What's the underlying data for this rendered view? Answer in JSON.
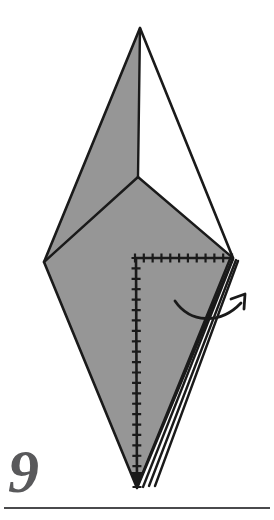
{
  "page": {
    "width": 274,
    "height": 520,
    "background_color": "#ffffff",
    "kind": "origami-instruction-step"
  },
  "step": {
    "number": "9",
    "number_color": "#59595b"
  },
  "rule": {
    "color": "#4a4a4c"
  },
  "colors": {
    "paper_front": "#969696",
    "paper_back": "#ffffff",
    "outline": "#1a1a1a",
    "hatch": "#1a1a1a",
    "arrow": "#1a1a1a"
  },
  "figure": {
    "vertices": {
      "apex": [
        140,
        28
      ],
      "left": [
        44,
        262
      ],
      "right": [
        233,
        258
      ],
      "bottom": [
        137,
        488
      ],
      "center": [
        138,
        177
      ]
    },
    "faces": [
      {
        "name": "upper-left-face",
        "fill": "paper_front",
        "points": "140,28 138,177 44,262"
      },
      {
        "name": "upper-right-face",
        "fill": "paper_back",
        "points": "140,28 233,258 138,177"
      },
      {
        "name": "lower-body-face",
        "fill": "paper_front",
        "points": "44,262 138,177 233,258 137,488"
      }
    ],
    "fold_lines": [
      {
        "name": "center-vertical-crease",
        "from": [
          140,
          28
        ],
        "to": [
          138,
          177
        ]
      },
      {
        "name": "center-left-crease",
        "from": [
          138,
          177
        ],
        "to": [
          44,
          262
        ]
      },
      {
        "name": "center-right-crease",
        "from": [
          138,
          177
        ],
        "to": [
          233,
          258
        ]
      }
    ],
    "layer_edges": [
      {
        "name": "layer-edge-1",
        "from": [
          230,
          259
        ],
        "to": [
          137,
          487
        ]
      },
      {
        "name": "layer-edge-2",
        "from": [
          233,
          259
        ],
        "to": [
          143,
          487
        ]
      },
      {
        "name": "layer-edge-3",
        "from": [
          236,
          260
        ],
        "to": [
          149,
          486
        ]
      },
      {
        "name": "layer-edge-4",
        "from": [
          238,
          261
        ],
        "to": [
          155,
          486
        ]
      }
    ]
  },
  "hatched_lines": [
    {
      "name": "horizontal-raw-edge",
      "orientation": "horizontal",
      "from": [
        135,
        258
      ],
      "to": [
        232,
        258
      ],
      "tick_count": 11,
      "tick_length": 9,
      "has_arrowhead": false
    },
    {
      "name": "vertical-raw-edge",
      "orientation": "vertical",
      "from": [
        136,
        258
      ],
      "to": [
        137,
        487
      ],
      "tick_count": 22,
      "tick_length": 9,
      "has_arrowhead": true,
      "arrowhead_at": "end"
    }
  ],
  "arrows": [
    {
      "name": "fold-rotate-arrow",
      "style": "curved-open-head",
      "description": "curved arrow sweeping from inside the model rightward and upward, indicating the flap rotates to the right",
      "path": "M 175,301 C 190,323 220,325 241,303",
      "head_tip": [
        245,
        294
      ],
      "head_arms": [
        [
          231,
          299
        ],
        [
          244,
          309
        ]
      ]
    }
  ]
}
